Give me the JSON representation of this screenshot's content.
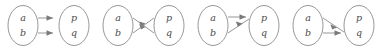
{
  "figure": {
    "width": 380,
    "height": 51,
    "background_color": "#ffffff",
    "stroke_color": "#8a8a8a",
    "arrow_fill_color": "#7a7a7a",
    "label_color": "#4a4a4a",
    "panel_count": 4,
    "domain_labels": [
      "a",
      "b"
    ],
    "codomain_labels": [
      "p",
      "q"
    ]
  },
  "panels": [
    {
      "index": 1,
      "name": "identity-map",
      "left_top": "a",
      "left_bottom": "b",
      "right_top": "p",
      "right_bottom": "q",
      "edges": [
        {
          "from": "a",
          "to": "p"
        },
        {
          "from": "b",
          "to": "q"
        }
      ]
    },
    {
      "index": 2,
      "name": "swap-map",
      "left_top": "a",
      "left_bottom": "b",
      "right_top": "p",
      "right_bottom": "q",
      "edges": [
        {
          "from": "a",
          "to": "q"
        },
        {
          "from": "b",
          "to": "p"
        }
      ]
    },
    {
      "index": 3,
      "name": "constant-p-map",
      "left_top": "a",
      "left_bottom": "b",
      "right_top": "p",
      "right_bottom": "q",
      "edges": [
        {
          "from": "a",
          "to": "p"
        },
        {
          "from": "b",
          "to": "p"
        }
      ]
    },
    {
      "index": 4,
      "name": "constant-q-map",
      "left_top": "a",
      "left_bottom": "b",
      "right_top": "p",
      "right_bottom": "q",
      "edges": [
        {
          "from": "a",
          "to": "q"
        },
        {
          "from": "b",
          "to": "q"
        }
      ]
    }
  ]
}
